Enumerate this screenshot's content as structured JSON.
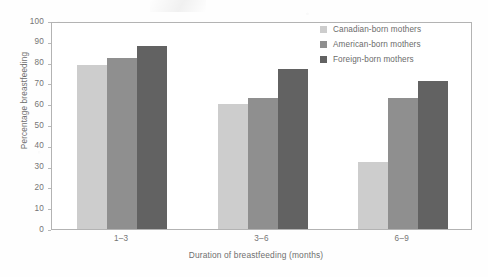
{
  "chart_data": {
    "type": "bar",
    "title": "",
    "subtitle": "",
    "xlabel": "Duration of breastfeeding (months)",
    "ylabel": "Percentage breastfeeding",
    "categories": [
      "1–3",
      "3–6",
      "6–9"
    ],
    "series": [
      {
        "name": "Canadian-born mothers",
        "color": "#cdcdcd",
        "values": [
          79,
          60,
          32
        ]
      },
      {
        "name": "American-born mothers",
        "color": "#8f8f8f",
        "values": [
          82,
          63,
          63
        ]
      },
      {
        "name": "Foreign-born mothers",
        "color": "#626262",
        "values": [
          88,
          77,
          71
        ]
      }
    ],
    "ylim": [
      0,
      100
    ],
    "yticks": [
      100,
      90,
      80,
      70,
      60,
      50,
      40,
      30,
      20,
      10,
      0
    ],
    "grid": false,
    "legend_position": "top-right",
    "axis_color": "#b3b3b3",
    "text_color": "#6f6f6f",
    "background": "#ffffff"
  }
}
